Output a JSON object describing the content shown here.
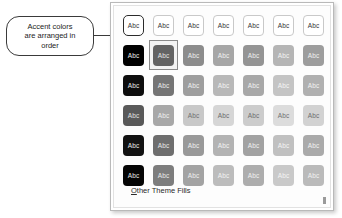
{
  "callout": {
    "text": "Accent colors\nare arranged in\norder",
    "border_color": "#3a3a3a"
  },
  "gallery": {
    "columns": 7,
    "rows": 6,
    "swatch_label": "Abc",
    "hovered_cell": {
      "row": 0,
      "col": 0
    },
    "selected_cell": {
      "row": 1,
      "col": 1
    },
    "footer": {
      "label": "Other Theme Fills",
      "accelerator": "O",
      "rest": "ther Theme Fills"
    },
    "colors": [
      [
        "#ffffff",
        "#ffffff",
        "#ffffff",
        "#ffffff",
        "#ffffff",
        "#ffffff",
        "#ffffff"
      ],
      [
        "#000000",
        "#636363",
        "#8c8c8c",
        "#a6a6a6",
        "#949494",
        "#b5b5b5",
        "#9d9d9d"
      ],
      [
        "#0d0d0d",
        "#757575",
        "#9e9e9e",
        "#b8b8b8",
        "#a8a8a8",
        "#c4c4c4",
        "#b0b0b0"
      ],
      [
        "#595959",
        "#a8a8a8",
        "#c8c8c8",
        "#d6d6d6",
        "#cccccc",
        "#dcdcdc",
        "#d2d2d2"
      ],
      [
        "#121212",
        "#6e6e6e",
        "#999999",
        "#b3b3b3",
        "#a2a2a2",
        "#c0c0c0",
        "#aaaaaa"
      ],
      [
        "#050505",
        "#7d7d7d",
        "#a3a3a3",
        "#bcbcbc",
        "#adadad",
        "#c9c9c9",
        "#bababa"
      ]
    ],
    "text_colors": [
      [
        "#333333",
        "#333333",
        "#333333",
        "#333333",
        "#333333",
        "#333333",
        "#333333"
      ],
      [
        "#ededed",
        "#e6e6e6",
        "#efefef",
        "#f2f2f2",
        "#f0f0f0",
        "#f4f4f4",
        "#f1f1f1"
      ],
      [
        "#e9e9e9",
        "#ececec",
        "#f1f1f1",
        "#f4f4f4",
        "#f2f2f2",
        "#f6f6f6",
        "#f3f3f3"
      ],
      [
        "#e2e2e2",
        "#f0f0f0",
        "#6f6f6f",
        "#6a6a6a",
        "#6c6c6c",
        "#707070",
        "#6d6d6d"
      ],
      [
        "#eaeaea",
        "#e9e9e9",
        "#f0f0f0",
        "#f3f3f3",
        "#f1f1f1",
        "#f5f5f5",
        "#f2f2f2"
      ],
      [
        "#e8e8e8",
        "#ebebeb",
        "#f0f0f0",
        "#f3f3f3",
        "#f1f1f1",
        "#f5f5f5",
        "#f2f2f2"
      ]
    ]
  }
}
